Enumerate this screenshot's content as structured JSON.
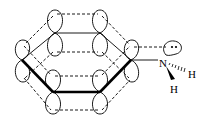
{
  "diagram": {
    "atoms": {
      "nitrogen": "N",
      "hydrogen_1": "H",
      "hydrogen_2": "H"
    },
    "lone_pair": ":",
    "colors": {
      "line": "#000000",
      "background": "#ffffff"
    }
  }
}
